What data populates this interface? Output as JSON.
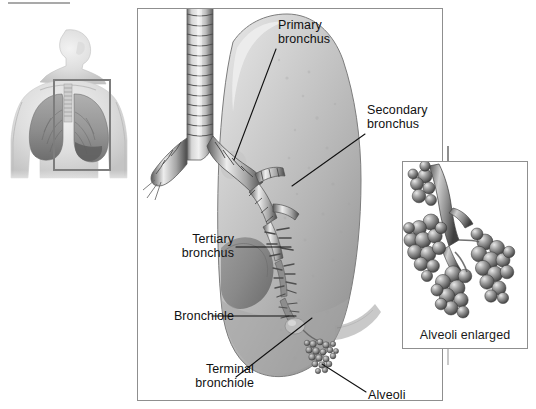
{
  "figure": {
    "kind": "anatomical-illustration",
    "background_color": "#ffffff",
    "line_color": "#111111",
    "panel_border_color": "#8f8f8f"
  },
  "torso_inset": {
    "name": "anterior thorax orientation figure",
    "highlight_box": {
      "color": "#7d7d7d",
      "description": "rectangle framing the left lung and trachea"
    }
  },
  "main_panel": {
    "name": "enlarged left lung with bronchial tree",
    "structures": [
      "trachea",
      "primary bronchus",
      "secondary bronchus",
      "tertiary bronchus",
      "bronchiole",
      "terminal bronchiole",
      "alveoli"
    ]
  },
  "labels": [
    {
      "id": "primary",
      "text": "Primary\nbronchus",
      "align": "left"
    },
    {
      "id": "secondary",
      "text": "Secondary\nbronchus",
      "align": "left"
    },
    {
      "id": "tertiary",
      "text": "Tertiary\nbronchus",
      "align": "right"
    },
    {
      "id": "bronchiole",
      "text": "Bronchiole",
      "align": "right"
    },
    {
      "id": "terminal",
      "text": "Terminal\nbronchiole",
      "align": "right"
    },
    {
      "id": "alveoli",
      "text": "Alveoli",
      "align": "left"
    }
  ],
  "alveoli_inset": {
    "caption": "Alveoli enlarged",
    "description": "grape-like clusters of alveolar sacs on a terminal bronchiole"
  }
}
